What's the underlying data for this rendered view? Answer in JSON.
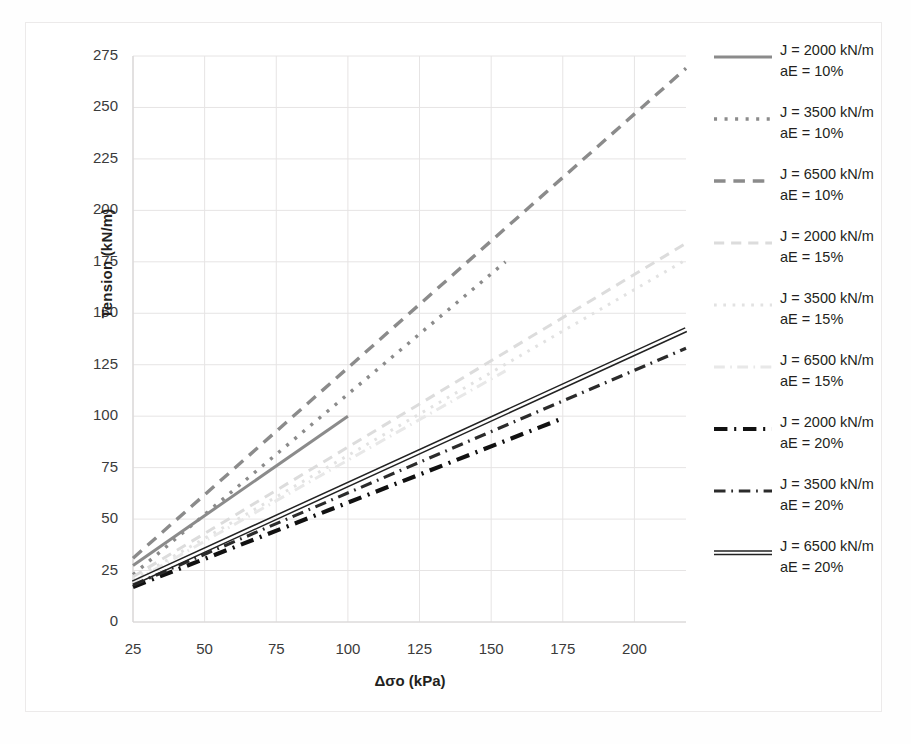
{
  "chart_data": {
    "type": "line",
    "title": "",
    "xlabel": "Δσo (kPa)",
    "ylabel": "Tension (kN/m)",
    "xlim": [
      25,
      218
    ],
    "ylim": [
      0,
      275
    ],
    "xticks": [
      "25",
      "50",
      "75",
      "100",
      "125",
      "150",
      "175",
      "200"
    ],
    "yticks": [
      "0",
      "25",
      "50",
      "75",
      "100",
      "125",
      "150",
      "175",
      "200",
      "225",
      "250",
      "275"
    ],
    "grid": true,
    "legend_position": "right",
    "series": [
      {
        "name": "J = 2000 kN/m aE = 10%",
        "label_line1": "J = 2000 kN/m",
        "label_line2": "aE = 10%",
        "style": "solid",
        "color": "#8b8b8b",
        "width": 3.0,
        "x": [
          25,
          100
        ],
        "y": [
          27.5,
          100.0
        ]
      },
      {
        "name": "J = 3500 kN/m aE = 10%",
        "label_line1": "J = 3500 kN/m",
        "label_line2": "aE = 10%",
        "style": "dotted",
        "color": "#8b8b8b",
        "width": 3.4,
        "x": [
          25,
          155
        ],
        "y": [
          23.0,
          175.0
        ]
      },
      {
        "name": "J = 6500 kN/m aE = 10%",
        "label_line1": "J = 6500 kN/m",
        "label_line2": "aE = 10%",
        "style": "dashed",
        "color": "#8b8b8b",
        "width": 3.4,
        "x": [
          25,
          218
        ],
        "y": [
          31.0,
          269.0
        ]
      },
      {
        "name": "J = 2000 kN/m aE = 15%",
        "label_line1": "J = 2000 kN/m",
        "label_line2": "aE = 15%",
        "style": "dashed-faint",
        "color": "#dcdcdc",
        "width": 3.0,
        "x": [
          25,
          218
        ],
        "y": [
          22.0,
          184.0
        ]
      },
      {
        "name": "J = 3500 kN/m aE = 15%",
        "label_line1": "J = 3500 kN/m",
        "label_line2": "aE = 15%",
        "style": "dotted-faint",
        "color": "#e2e2e2",
        "width": 3.0,
        "x": [
          25,
          218
        ],
        "y": [
          20.5,
          176.0
        ]
      },
      {
        "name": "J = 6500 kN/m aE = 15%",
        "label_line1": "J = 6500 kN/m",
        "label_line2": "aE = 15%",
        "style": "dashdot-faint",
        "color": "#e8e8e8",
        "width": 3.0,
        "x": [
          25,
          155
        ],
        "y": [
          19.5,
          122.0
        ]
      },
      {
        "name": "J = 2000 kN/m aE = 20%",
        "label_line1": "J = 2000 kN/m",
        "label_line2": "aE = 20%",
        "style": "dashdot-heavy",
        "color": "#111111",
        "width": 4.2,
        "x": [
          25,
          175
        ],
        "y": [
          17.0,
          99.0
        ]
      },
      {
        "name": "J = 3500 kN/m aE = 20%",
        "label_line1": "J = 3500 kN/m",
        "label_line2": "aE = 20%",
        "style": "dashdot",
        "color": "#2b2b2b",
        "width": 3.2,
        "x": [
          25,
          218
        ],
        "y": [
          18.0,
          133.0
        ]
      },
      {
        "name": "J = 6500 kN/m aE = 20%",
        "label_line1": "J = 6500 kN/m",
        "label_line2": "aE = 20%",
        "style": "double-solid",
        "color": "#222222",
        "width": 3.2,
        "x": [
          25,
          218
        ],
        "y": [
          19.0,
          142.0
        ]
      }
    ]
  }
}
